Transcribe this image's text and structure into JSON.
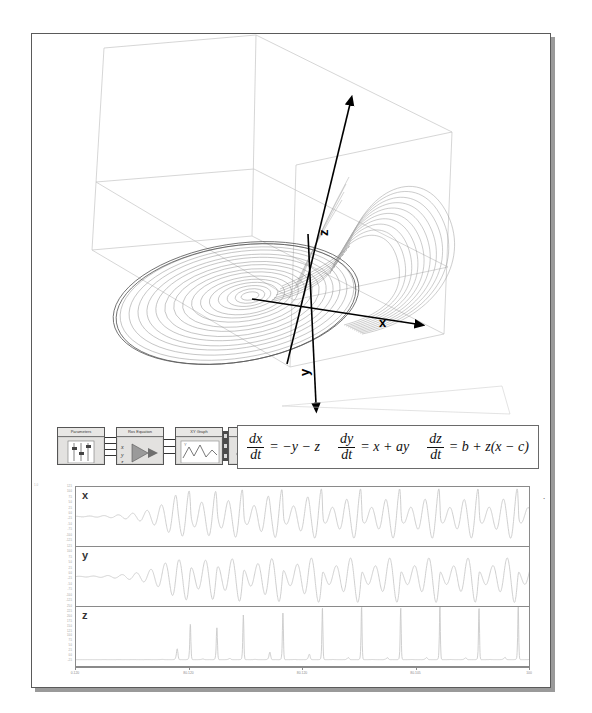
{
  "figure": {
    "axes_3d": {
      "x_label": "x",
      "y_label": "y",
      "z_label": "z"
    }
  },
  "block_diagram": {
    "blocks": [
      {
        "title": "Parameters",
        "icon": "slider-panel-icon"
      },
      {
        "title": "Ros Equation",
        "icon": "formula-node-icon"
      },
      {
        "title": "XY Graph",
        "icon": "waveform-graph-icon"
      },
      {
        "title": "xyz Direction",
        "icon": "3d-curve-icon"
      }
    ]
  },
  "equations": [
    {
      "name": "dx-dt",
      "num": "dx",
      "den": "dt",
      "rhs": "= −y − z"
    },
    {
      "name": "dy-dt",
      "num": "dy",
      "den": "dt",
      "rhs": "= x + ay"
    },
    {
      "name": "dz-dt",
      "num": "dz",
      "den": "dt",
      "rhs": "= b + z(x − c)"
    }
  ],
  "chart_data": [
    {
      "type": "line",
      "name": "x-time-series",
      "title": "x",
      "xlabel": "",
      "ylabel": "x",
      "ylim": [
        -12.5,
        12.5
      ],
      "xlim": [
        0,
        100
      ],
      "yticks": [
        "12.5",
        "10.0",
        "7.5",
        "5.0",
        "2.5",
        "0.0",
        "-2.5",
        "-5.0",
        "-7.5",
        "-10.0",
        "-12.5"
      ],
      "grid": false,
      "series": [
        {
          "name": "x",
          "color": "#c9c9c9"
        }
      ]
    },
    {
      "type": "line",
      "name": "y-time-series",
      "title": "y",
      "xlabel": "",
      "ylabel": "y",
      "ylim": [
        -12.5,
        12.5
      ],
      "xlim": [
        0,
        100
      ],
      "yticks": [
        "12.5",
        "10.0",
        "7.5",
        "5.0",
        "2.5",
        "0.0",
        "-2.5",
        "-5.0",
        "-7.5",
        "-10.0",
        "-12.5"
      ],
      "grid": false,
      "series": [
        {
          "name": "y",
          "color": "#c9c9c9"
        }
      ]
    },
    {
      "type": "line",
      "name": "z-time-series",
      "title": "z",
      "xlabel": "",
      "ylabel": "z",
      "ylim": [
        -2.5,
        25.0
      ],
      "xlim": [
        0,
        100
      ],
      "yticks": [
        "25.0",
        "22.5",
        "20.0",
        "17.5",
        "15.0",
        "12.5",
        "10.0",
        "7.5",
        "5.0",
        "2.5",
        "0.0",
        "-2.5"
      ],
      "grid": false,
      "series": [
        {
          "name": "z",
          "color": "#c9c9c9"
        }
      ]
    }
  ],
  "x_axis": {
    "ticks": [
      "0.120",
      "80.120",
      "80.120",
      "80.105",
      "100"
    ],
    "positions": [
      0,
      25,
      50,
      75,
      100
    ]
  }
}
